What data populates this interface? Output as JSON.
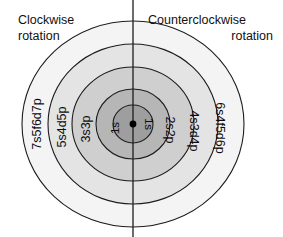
{
  "figure": {
    "name": "electron-shell-rotation-diagram",
    "background_color": "#ffffff",
    "center": {
      "x": 133,
      "y": 124
    },
    "nucleus": {
      "label": "nucleus-dot",
      "radius": 3.4,
      "color": "#000000"
    },
    "divider": {
      "name": "vertical-axis-line",
      "x": 133,
      "y_top": 0,
      "y_bottom": 237,
      "color": "#1c1c1c"
    }
  },
  "headings": {
    "left": {
      "line1": "Clockwise",
      "line2": "rotation"
    },
    "right": {
      "line1": "Counterclockwise",
      "line2": "rotation"
    }
  },
  "shells": [
    {
      "index": 5,
      "name": "shell-outer",
      "rx": 111,
      "ry": 103,
      "fill": "#f4f4f4",
      "stroke": "#1c1c1c",
      "left_label": "7s5f6d7p",
      "right_label": "6s4f5d6p"
    },
    {
      "index": 4,
      "name": "shell-four",
      "rx": 85,
      "ry": 80,
      "fill": "#e4e4e4",
      "stroke": "#1c1c1c",
      "left_label": "5s4d5p",
      "right_label": "4s3d4p"
    },
    {
      "index": 3,
      "name": "shell-three",
      "rx": 61,
      "ry": 57,
      "fill": "#cfcfcf",
      "stroke": "#1c1c1c",
      "left_label": "3s3p",
      "right_label": "2s2p"
    },
    {
      "index": 2,
      "name": "shell-two",
      "rx": 37,
      "ry": 35,
      "fill": "#b6b6b6",
      "stroke": "#1c1c1c",
      "left_label": "",
      "right_label": ""
    },
    {
      "index": 1,
      "name": "shell-inner",
      "rx": 20,
      "ry": 19,
      "fill": "#9e9e9e",
      "stroke": "#1c1c1c",
      "left_label": "1s",
      "right_label": "1s"
    }
  ],
  "orbital_labels": {
    "left": [
      "1s",
      "3s3p",
      "5s4d5p",
      "7s5f6d7p"
    ],
    "right": [
      "1s",
      "2s2p",
      "4s3d4p",
      "6s4f5d6p"
    ]
  },
  "colors": {
    "outline": "#1c1c1c",
    "text": "#0d0d0d",
    "background": "#ffffff"
  }
}
